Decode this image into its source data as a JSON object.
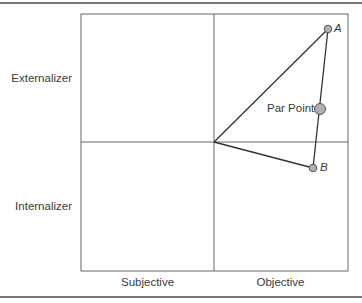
{
  "diagram": {
    "y_labels": {
      "top": "Externalizer",
      "bottom": "Internalizer"
    },
    "x_labels": {
      "left": "Subjective",
      "right": "Objective"
    },
    "points": [
      {
        "id": "A",
        "label": "A"
      },
      {
        "id": "par",
        "label": "Par Point"
      },
      {
        "id": "B",
        "label": "B"
      }
    ],
    "colors": {
      "line": "#444444",
      "grid": "#666666",
      "point_fill": "#b0b0b0",
      "point_stroke": "#555555"
    }
  }
}
